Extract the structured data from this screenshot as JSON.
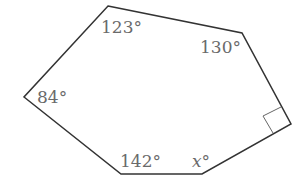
{
  "figure": {
    "type": "hexagon",
    "stroke_color": "#333333",
    "label_color": "#6a6a6a",
    "vertices": [
      {
        "name": "top",
        "x": 108,
        "y": 6
      },
      {
        "name": "top-right",
        "x": 242,
        "y": 33
      },
      {
        "name": "right",
        "x": 291,
        "y": 124
      },
      {
        "name": "bottom-right",
        "x": 202,
        "y": 174
      },
      {
        "name": "bottom-left",
        "x": 121,
        "y": 174
      },
      {
        "name": "left",
        "x": 24,
        "y": 97
      }
    ],
    "angles": {
      "top": "123°",
      "top_right": "130°",
      "right": "right angle",
      "bottom_right_var": "x",
      "bottom_right_deg": "°",
      "bottom_left": "142°",
      "left": "84°"
    }
  }
}
